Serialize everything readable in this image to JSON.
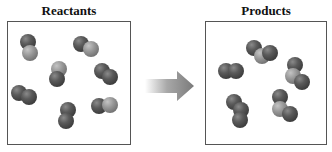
{
  "reactants": {
    "title": "Reactants",
    "molecules": [
      {
        "x": 20,
        "y": 34,
        "atoms": [
          {
            "dx": 0,
            "dy": 0,
            "c": "dark"
          },
          {
            "dx": 2,
            "dy": 11,
            "c": "light"
          }
        ]
      },
      {
        "x": 73,
        "y": 36,
        "atoms": [
          {
            "dx": 0,
            "dy": 0,
            "c": "dark"
          },
          {
            "dx": 10,
            "dy": 5,
            "c": "light"
          }
        ]
      },
      {
        "x": 49,
        "y": 61,
        "atoms": [
          {
            "dx": 2,
            "dy": 0,
            "c": "light"
          },
          {
            "dx": 0,
            "dy": 10,
            "c": "dark"
          }
        ]
      },
      {
        "x": 94,
        "y": 63,
        "atoms": [
          {
            "dx": 0,
            "dy": 0,
            "c": "dark"
          },
          {
            "dx": 8,
            "dy": 6,
            "c": "dark"
          }
        ]
      },
      {
        "x": 11,
        "y": 85,
        "atoms": [
          {
            "dx": 0,
            "dy": 0,
            "c": "dark"
          },
          {
            "dx": 10,
            "dy": 4,
            "c": "dark"
          }
        ]
      },
      {
        "x": 58,
        "y": 102,
        "atoms": [
          {
            "dx": 2,
            "dy": 0,
            "c": "dark"
          },
          {
            "dx": 0,
            "dy": 11,
            "c": "dark"
          }
        ]
      },
      {
        "x": 91,
        "y": 98,
        "atoms": [
          {
            "dx": 0,
            "dy": 0,
            "c": "dark"
          },
          {
            "dx": 11,
            "dy": -1,
            "c": "light"
          }
        ]
      }
    ]
  },
  "arrow": {
    "direction": "right",
    "color": "#8a8a8a"
  },
  "products": {
    "title": "Products",
    "molecules": [
      {
        "x": 246,
        "y": 40,
        "atoms": [
          {
            "dx": 0,
            "dy": 0,
            "c": "dark"
          },
          {
            "dx": 8,
            "dy": 8,
            "c": "light"
          },
          {
            "dx": 16,
            "dy": 5,
            "c": "dark"
          }
        ]
      },
      {
        "x": 218,
        "y": 63,
        "atoms": [
          {
            "dx": 0,
            "dy": 0,
            "c": "dark"
          },
          {
            "dx": 10,
            "dy": 0,
            "c": "dark"
          }
        ]
      },
      {
        "x": 285,
        "y": 57,
        "atoms": [
          {
            "dx": 2,
            "dy": 0,
            "c": "dark"
          },
          {
            "dx": 0,
            "dy": 11,
            "c": "light"
          },
          {
            "dx": 9,
            "dy": 17,
            "c": "dark"
          }
        ]
      },
      {
        "x": 226,
        "y": 94,
        "atoms": [
          {
            "dx": 0,
            "dy": 0,
            "c": "dark"
          },
          {
            "dx": 7,
            "dy": 8,
            "c": "dark"
          },
          {
            "dx": 6,
            "dy": 18,
            "c": "dark"
          }
        ]
      },
      {
        "x": 272,
        "y": 89,
        "atoms": [
          {
            "dx": 0,
            "dy": 0,
            "c": "dark"
          },
          {
            "dx": 0,
            "dy": 12,
            "c": "light"
          },
          {
            "dx": 10,
            "dy": 17,
            "c": "dark"
          }
        ]
      }
    ]
  }
}
